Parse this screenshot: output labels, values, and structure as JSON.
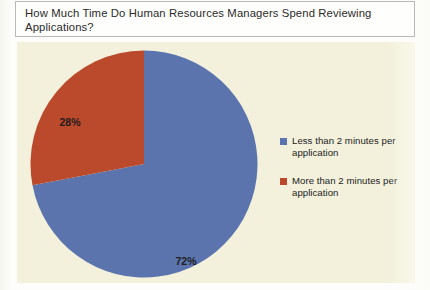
{
  "title": {
    "text": "How Much Time Do Human Resources Managers Spend Reviewing Applications?"
  },
  "colors": {
    "series_blue": "#5b74ad",
    "series_orange": "#bb4a2c",
    "chart_background": "#f3f1dc",
    "page_background": "#fdfdfb",
    "title_border": "#b9b9b5",
    "label_text": "#1d1d1d"
  },
  "legend": {
    "position": "right",
    "items": [
      {
        "label": "Less than 2 minutes per application",
        "color": "#5b74ad",
        "swatch_name": "legend-swatch-blue"
      },
      {
        "label": "More than 2 minutes per application",
        "color": "#bb4a2c",
        "swatch_name": "legend-swatch-orange"
      }
    ]
  },
  "labels": {
    "slice_blue": "72%",
    "slice_orange": "28%"
  },
  "chart_data": {
    "type": "pie",
    "title": "How Much Time Do Human Resources Managers Spend Reviewing Applications?",
    "xlabel": "",
    "ylabel": "",
    "legend_position": "right",
    "grid": false,
    "start_angle_deg": 0,
    "direction": "clockwise",
    "categories": [
      "Less than 2 minutes per application",
      "More than 2 minutes per application"
    ],
    "values": [
      72,
      28
    ],
    "data_labels": [
      "72%",
      "28%"
    ],
    "colors": [
      "#5b74ad",
      "#bb4a2c"
    ],
    "units": "percent",
    "total": 100
  }
}
